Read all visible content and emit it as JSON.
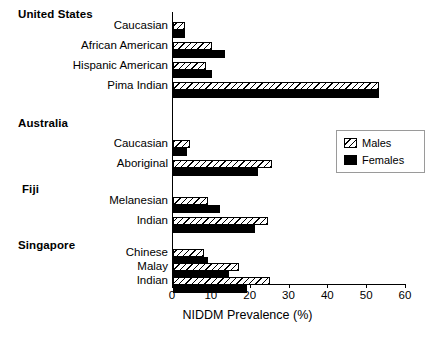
{
  "chart_data": {
    "type": "bar",
    "orientation": "horizontal",
    "title": "",
    "xlabel": "NIDDM Prevalence (%)",
    "ylabel": "",
    "xlim": [
      0,
      60
    ],
    "xticks": [
      0,
      10,
      20,
      30,
      40,
      50,
      60
    ],
    "grid": false,
    "legend_position": "center-right",
    "legend": [
      "Males",
      "Females"
    ],
    "series": [
      {
        "name": "Males",
        "values": [
          3.0,
          10.0,
          8.5,
          53.0,
          4.5,
          25.5,
          9.0,
          24.5,
          8.0,
          17.0,
          25.0
        ]
      },
      {
        "name": "Females",
        "values": [
          3.0,
          13.5,
          10.0,
          53.0,
          3.5,
          22.0,
          12.0,
          21.0,
          9.0,
          14.5,
          19.0
        ]
      }
    ],
    "categories": [
      "Caucasian",
      "African American",
      "Hispanic American",
      "Pima Indian",
      "Caucasian",
      "Aboriginal",
      "Melanesian",
      "Indian",
      "Chinese",
      "Malay",
      "Indian"
    ],
    "groups": [
      {
        "label": "United States",
        "categories": [
          "Caucasian",
          "African American",
          "Hispanic American",
          "Pima Indian"
        ]
      },
      {
        "label": "Australia",
        "categories": [
          "Caucasian",
          "Aboriginal"
        ]
      },
      {
        "label": "Fiji",
        "categories": [
          "Melanesian",
          "Indian"
        ]
      },
      {
        "label": "Singapore",
        "categories": [
          "Chinese",
          "Malay",
          "Indian"
        ]
      }
    ]
  },
  "groups": [
    {
      "header": "United States"
    },
    {
      "header": "Australia"
    },
    {
      "header": "Fiji"
    },
    {
      "header": "Singapore"
    }
  ],
  "rows": [
    {
      "label": "Caucasian",
      "males": 3.0,
      "females": 3.0
    },
    {
      "label": "African American",
      "males": 10.0,
      "females": 13.5
    },
    {
      "label": "Hispanic American",
      "males": 8.5,
      "females": 10.0
    },
    {
      "label": "Pima Indian",
      "males": 53.0,
      "females": 53.0
    },
    {
      "label": "Caucasian",
      "males": 4.5,
      "females": 3.5
    },
    {
      "label": "Aboriginal",
      "males": 25.5,
      "females": 22.0
    },
    {
      "label": "Melanesian",
      "males": 9.0,
      "females": 12.0
    },
    {
      "label": "Indian",
      "males": 24.5,
      "females": 21.0
    },
    {
      "label": "Chinese",
      "males": 8.0,
      "females": 9.0
    },
    {
      "label": "Malay",
      "males": 17.0,
      "females": 14.5
    },
    {
      "label": "Indian",
      "males": 25.0,
      "females": 19.0
    }
  ],
  "axis": {
    "title": "NIDDM Prevalence (%)",
    "ticks": [
      "0",
      "10",
      "20",
      "30",
      "40",
      "50",
      "60"
    ]
  },
  "legend": {
    "males_label": "Males",
    "females_label": "Females"
  },
  "colors": {
    "bar_outline": "#000000",
    "females_fill": "#000000",
    "males_fill": "#ffffff",
    "axis": "#000000",
    "legend_border": "#9a9a9a",
    "background": "#ffffff"
  }
}
